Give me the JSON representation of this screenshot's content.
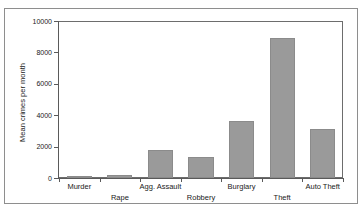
{
  "chart_data": {
    "type": "bar",
    "title": "",
    "subtitle": "",
    "xlabel": "",
    "ylabel": "Mean crimes per month",
    "categories": [
      "Murder",
      "Rape",
      "Agg. Assault",
      "Robbery",
      "Burglary",
      "Theft",
      "Auto Theft"
    ],
    "values": [
      80,
      180,
      1800,
      1340,
      3650,
      8900,
      3100
    ],
    "ylim": [
      0,
      10000
    ],
    "yticks": [
      0,
      2000,
      4000,
      6000,
      8000,
      10000
    ],
    "ytick_labels": [
      "0",
      "2000",
      "4000",
      "6000",
      "8000",
      "10000"
    ],
    "grid": false,
    "legend": null,
    "bar_color": "#9a9a9a",
    "bar_edge_color": "#8b8b8b",
    "axis_color": "#5a5a5a",
    "frame_color": "#8e8e8e",
    "background": "#ffffff"
  },
  "axis": {
    "y_title": "Mean crimes per month"
  }
}
